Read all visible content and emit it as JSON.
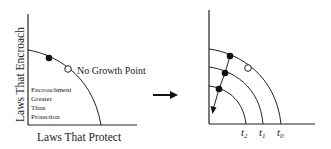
{
  "left_panel": {
    "y_axis_label": "Laws That Encroach",
    "x_axis_label": "Laws That Protect",
    "point_label": "No Growth Point",
    "region_label_lines": [
      "Encroachment",
      "Greater",
      "Than",
      "Protection"
    ]
  },
  "transition_arrow": "right-arrow",
  "right_panel": {
    "curve_labels": [
      "t",
      "t",
      "t"
    ],
    "curve_subscripts": [
      "2",
      "1",
      "0"
    ]
  }
}
